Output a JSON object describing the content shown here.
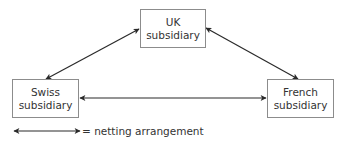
{
  "diagram": {
    "type": "netting-triangle",
    "nodes": {
      "uk": {
        "line1": "UK",
        "line2": "subsidiary"
      },
      "swiss": {
        "line1": "Swiss",
        "line2": "subsidiary"
      },
      "french": {
        "line1": "French",
        "line2": "subsidiary"
      }
    },
    "edges": [
      {
        "from": "swiss",
        "to": "uk",
        "style": "double-headed-arrow"
      },
      {
        "from": "uk",
        "to": "french",
        "style": "double-headed-arrow"
      },
      {
        "from": "swiss",
        "to": "french",
        "style": "double-headed-arrow"
      }
    ],
    "legend": {
      "symbol": "double-headed-arrow",
      "text": "= netting arrangement"
    },
    "colors": {
      "line": "#2a2a2a",
      "box_border": "#8c8c8c",
      "text": "#333333"
    }
  }
}
